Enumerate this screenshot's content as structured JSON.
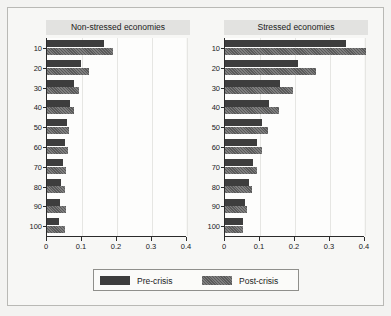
{
  "legend": {
    "position": "bottom",
    "entries": [
      {
        "label": "Pre-crisis",
        "swatch": "legend-swatch-pre",
        "color": "#3d3d3d"
      },
      {
        "label": "Post-crisis",
        "swatch": "legend-swatch-post",
        "color": "#5a5a5a"
      }
    ]
  },
  "chart_data": {
    "type": "bar",
    "orientation": "horizontal",
    "title": "",
    "xlabel": "",
    "ylabel": "",
    "xlim": [
      0,
      0.4
    ],
    "xticks": [
      0,
      0.1,
      0.2,
      0.3,
      0.4
    ],
    "xtick_labels": [
      "0",
      "0.1",
      "0.2",
      "0.3",
      "0.4"
    ],
    "categories": [
      "10",
      "20",
      "30",
      "40",
      "50",
      "60",
      "70",
      "80",
      "90",
      "100"
    ],
    "grid": "vertical",
    "series_names": [
      "Pre-crisis",
      "Post-crisis"
    ],
    "panels": [
      {
        "title": "Non-stressed economies",
        "series": [
          {
            "name": "Pre-crisis",
            "values": [
              0.163,
              0.097,
              0.078,
              0.066,
              0.058,
              0.05,
              0.047,
              0.041,
              0.038,
              0.034
            ]
          },
          {
            "name": "Post-crisis",
            "values": [
              0.188,
              0.119,
              0.092,
              0.077,
              0.063,
              0.06,
              0.055,
              0.052,
              0.053,
              0.052
            ]
          }
        ]
      },
      {
        "title": "Stressed economies",
        "series": [
          {
            "name": "Pre-crisis",
            "values": [
              0.345,
              0.208,
              0.156,
              0.127,
              0.105,
              0.092,
              0.079,
              0.069,
              0.058,
              0.05
            ]
          },
          {
            "name": "Post-crisis",
            "values": [
              0.402,
              0.259,
              0.194,
              0.153,
              0.124,
              0.105,
              0.09,
              0.076,
              0.064,
              0.052
            ]
          }
        ]
      }
    ]
  }
}
